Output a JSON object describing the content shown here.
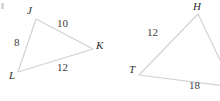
{
  "figure": {
    "kind": "geometry-diagram",
    "stroke_color": "#d2d2d2",
    "label_color": "#333333",
    "background_color": "#ffffff",
    "corner_mark_color": "#d8d8d8"
  },
  "triangles": [
    {
      "id": "JKL",
      "name": "triangle-jkl",
      "vertices": [
        {
          "name": "J",
          "label": "J",
          "x": 36,
          "y": 19,
          "label_x": 27,
          "label_y": 5
        },
        {
          "name": "K",
          "label": "K",
          "x": 93,
          "y": 49,
          "label_x": 96,
          "label_y": 40
        },
        {
          "name": "L",
          "label": "L",
          "x": 18,
          "y": 72,
          "label_x": 9,
          "label_y": 70
        }
      ],
      "sides": [
        {
          "name": "JK",
          "label": "10",
          "label_x": 57,
          "label_y": 18
        },
        {
          "name": "JL",
          "label": "8",
          "label_x": 14,
          "label_y": 37
        },
        {
          "name": "LK",
          "label": "12",
          "label_x": 57,
          "label_y": 62
        }
      ]
    },
    {
      "id": "HTX",
      "name": "triangle-htx",
      "vertices": [
        {
          "name": "H",
          "label": "H",
          "x": 198,
          "y": 14,
          "label_x": 193,
          "label_y": 1
        },
        {
          "name": "T",
          "label": "T",
          "x": 139,
          "y": 75,
          "label_x": 129,
          "label_y": 64
        },
        {
          "name": "X",
          "label": "",
          "x": 233,
          "y": 87,
          "label_x": 0,
          "label_y": 0
        }
      ],
      "sides": [
        {
          "name": "HT",
          "label": "12",
          "label_x": 147,
          "label_y": 27
        },
        {
          "name": "TX",
          "label": "18",
          "label_x": 189,
          "label_y": 80
        }
      ]
    }
  ]
}
